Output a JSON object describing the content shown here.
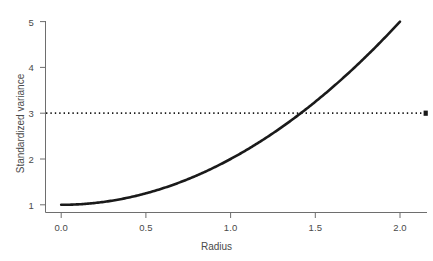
{
  "chart_data": {
    "type": "line",
    "title": "",
    "subtitle": "",
    "xlabel": "Radius",
    "ylabel": "Standardized variance",
    "xlim": [
      -0.11,
      2.13
    ],
    "ylim": [
      0.82,
      5.18
    ],
    "xticks": [
      0.0,
      0.5,
      1.0,
      1.5,
      2.0
    ],
    "xticklabels": [
      "0.0",
      "0.5",
      "1.0",
      "1.5",
      "2.0"
    ],
    "yticks": [
      1,
      2,
      3,
      4,
      5
    ],
    "yticklabels": [
      "1",
      "2",
      "3",
      "4",
      "5"
    ],
    "grid": false,
    "legend": null,
    "series": [
      {
        "name": "Standardized variance",
        "kind": "line",
        "formula": "1 + r^2",
        "color": "#1a1a1a",
        "linewidth": 2.6,
        "linestyle": "solid",
        "x": [
          0.0,
          0.1,
          0.2,
          0.3,
          0.4,
          0.5,
          0.6,
          0.7,
          0.8,
          0.9,
          1.0,
          1.1,
          1.2,
          1.3,
          1.4,
          1.5,
          1.6,
          1.7,
          1.8,
          1.9,
          2.0
        ],
        "y": [
          1.0,
          1.01,
          1.04,
          1.09,
          1.16,
          1.25,
          1.36,
          1.49,
          1.64,
          1.81,
          2.0,
          2.21,
          2.44,
          2.69,
          2.96,
          3.25,
          3.56,
          3.89,
          4.24,
          4.61,
          5.0
        ]
      },
      {
        "name": "Reference level",
        "kind": "hline",
        "color": "#1a1a1a",
        "linewidth": 1.6,
        "linestyle": "dotted",
        "value": 3,
        "x_start": -0.11,
        "x_end": 2.13,
        "endpoint_marker": "square"
      }
    ],
    "annotations": [
      {
        "label": "curve crosses reference level",
        "x": 1.414,
        "y": 3.0
      }
    ],
    "axes_color": "#6e6e6e",
    "background": "#ffffff"
  },
  "axes": {
    "x_title": "Radius",
    "y_title": "Standardized variance"
  },
  "ticks": {
    "x": [
      "0.0",
      "0.5",
      "1.0",
      "1.5",
      "2.0"
    ],
    "y": [
      "1",
      "2",
      "3",
      "4",
      "5"
    ]
  }
}
